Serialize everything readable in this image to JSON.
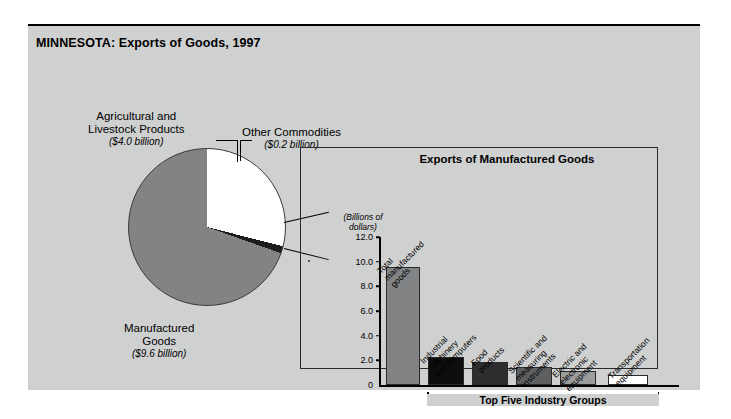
{
  "figure": {
    "title": "MINNESOTA: Exports of Goods, 1997",
    "background_color": "#cfd0d0"
  },
  "pie": {
    "labels": {
      "agricultural": {
        "name": "Agricultural and\nLivestock Products",
        "line1": "Agricultural and",
        "line2": "Livestock Products",
        "amount": "($4.0 billion)"
      },
      "other": {
        "line1": "Other Commodities",
        "amount": "($0.2 billion)"
      },
      "manufactured": {
        "line1": "Manufactured",
        "line2": "Goods",
        "amount": "($9.6 billion)"
      }
    }
  },
  "inset": {
    "title": "Exports of Manufactured Goods",
    "axis_units_line1": "(Billions of",
    "axis_units_line2": "dollars)",
    "bracket_label": "Top Five Industry Groups"
  },
  "chart_data": [
    {
      "type": "pie",
      "title": "MINNESOTA: Exports of Goods, 1997",
      "unit": "billions of dollars",
      "total": 13.8,
      "slices": [
        {
          "label": "Manufactured Goods",
          "value": 9.6,
          "display": "($9.6 billion)",
          "color": "#818384",
          "percent": 69.6
        },
        {
          "label": "Agricultural and Livestock Products",
          "value": 4.0,
          "display": "($4.0 billion)",
          "color": "#ffffff",
          "percent": 29.0
        },
        {
          "label": "Other Commodities",
          "value": 0.2,
          "display": "($0.2 billion)",
          "color": "#1c1c1c",
          "percent": 1.4
        }
      ],
      "legend": "labels-with-leader-lines"
    },
    {
      "type": "bar",
      "title": "Exports of Manufactured Goods",
      "xlabel": "",
      "ylabel": "(Billions of dollars)",
      "ylim": [
        0,
        12.0
      ],
      "yticks": [
        "0",
        "2.0",
        "4.0",
        "6.0",
        "8.0",
        "10.0",
        "12.0"
      ],
      "ytick_values": [
        0,
        2,
        4,
        6,
        8,
        10,
        12
      ],
      "grid": false,
      "legend": "none",
      "annotation": "Top Five Industry Groups",
      "categories": [
        "Total manufactured goods",
        "Industrial machinery and computers",
        "Food products",
        "Scientific and measuring instruments",
        "Electric and electronic equipment",
        "Transportation equipment"
      ],
      "values": [
        9.6,
        2.25,
        1.85,
        1.45,
        1.1,
        0.8
      ],
      "bar_colors": [
        "#818384",
        "#0d0d0d",
        "#2e2e2e",
        "#5d5f60",
        "#9b9d9d",
        "#ffffff"
      ],
      "label_lines": [
        [
          "Total",
          "manufactured",
          "goods"
        ],
        [
          "Industrial",
          "machinery",
          "and computers"
        ],
        [
          "Food",
          "products"
        ],
        [
          "Scientific and",
          "measuring",
          "instruments"
        ],
        [
          "Electric and",
          "electronic",
          "equipment"
        ],
        [
          "Transportation",
          "equipment"
        ]
      ]
    }
  ]
}
